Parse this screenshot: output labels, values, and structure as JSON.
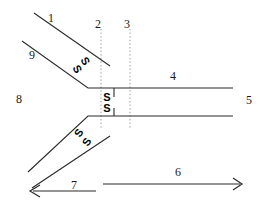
{
  "diagram": {
    "background_color": "#ffffff",
    "line_color": "#2b2b2b",
    "dotted_color": "#9a9a9a",
    "text_color": "#1a1a1a",
    "labels": {
      "one": "1",
      "two": "2",
      "three": "3",
      "four": "4",
      "five": "5",
      "six": "6",
      "seven": "7",
      "eight": "8",
      "nine": "9"
    },
    "markers": {
      "s_upper_diag_a": "S",
      "s_upper_diag_b": "S",
      "s_center_top": "S",
      "s_center_bottom": "S",
      "s_lower_diag_a": "S",
      "s_lower_diag_b": "S"
    },
    "geometry": {
      "upper_diag_1": "M 34,13 L 110,66",
      "upper_diag_9": "M 22,41 L 88,88",
      "upper_horizontal": "M 88,88 L 233,88",
      "lower_horizontal": "M 88,116 L 233,116",
      "lower_diag_a": "M 88,116 L 28,172",
      "lower_diag_b": "M 110,136 L 32,188",
      "arrow_six_line": "M 103,184 L 240,184",
      "arrow_seven_line": "M 95,191 L 30,191",
      "dotted_two": "M 101,28 L 101,128",
      "dotted_three": "M 130,28 L 130,128"
    }
  }
}
